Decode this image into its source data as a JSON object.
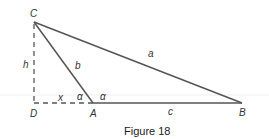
{
  "figure": {
    "caption": "Figure 18",
    "vertices": {
      "A": {
        "label": "A",
        "x": 93,
        "y": 103
      },
      "B": {
        "label": "B",
        "x": 242,
        "y": 103
      },
      "C": {
        "label": "C",
        "x": 34,
        "y": 22
      },
      "D": {
        "label": "D",
        "x": 34,
        "y": 103
      }
    },
    "sides": {
      "a": "a",
      "b": "b",
      "c": "c",
      "h": "h",
      "x": "x"
    },
    "angles": {
      "alpha_interior": "α",
      "alpha_exterior": "α"
    },
    "colors": {
      "line": "#555555",
      "dashed": "#555555",
      "guide": "#eeeeee"
    }
  }
}
